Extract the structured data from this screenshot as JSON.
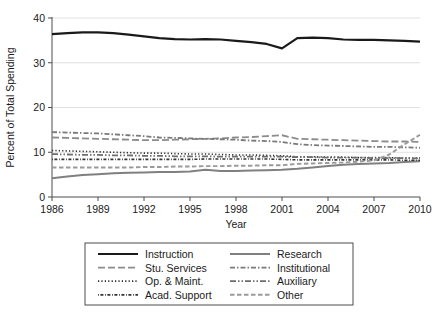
{
  "chart_data": {
    "type": "line",
    "title": "",
    "subtitle": "",
    "xlabel": "Year",
    "ylabel": "Percent of Total Spending",
    "xlim": [
      1986,
      2010
    ],
    "ylim": [
      0,
      40
    ],
    "xticks": [
      1986,
      1989,
      1992,
      1995,
      1998,
      2001,
      2004,
      2007,
      2010
    ],
    "xtick_labels": [
      "1986",
      "1989",
      "1992",
      "1995",
      "1998",
      "2001",
      "2004",
      "2007",
      "2010"
    ],
    "yticks": [
      0,
      10,
      20,
      30,
      40
    ],
    "ytick_labels": [
      "0",
      "10",
      "20",
      "30",
      "40"
    ],
    "grid": "horizontal",
    "legend_position": "below-plot",
    "legend_columns": 2,
    "x": [
      1986,
      1987,
      1988,
      1989,
      1990,
      1991,
      1992,
      1993,
      1994,
      1995,
      1996,
      1997,
      1998,
      1999,
      2000,
      2001,
      2002,
      2003,
      2004,
      2005,
      2006,
      2007,
      2008,
      2009,
      2010
    ],
    "series": [
      {
        "name": "Instruction",
        "color": "#1a1a1a",
        "dash": "none",
        "width": 2.2,
        "values": [
          36.4,
          36.6,
          36.8,
          36.8,
          36.6,
          36.3,
          35.9,
          35.5,
          35.3,
          35.2,
          35.3,
          35.2,
          34.9,
          34.6,
          34.2,
          33.2,
          35.5,
          35.6,
          35.5,
          35.2,
          35.1,
          35.1,
          35.0,
          34.9,
          34.7
        ]
      },
      {
        "name": "Research",
        "color": "#808080",
        "dash": "none",
        "width": 2.0,
        "values": [
          4.2,
          4.6,
          4.9,
          5.1,
          5.3,
          5.4,
          5.5,
          5.6,
          5.6,
          5.7,
          6.1,
          5.8,
          5.8,
          5.9,
          6.0,
          6.1,
          6.3,
          6.6,
          6.9,
          7.2,
          7.4,
          7.5,
          7.6,
          7.8,
          8.0
        ]
      },
      {
        "name": "Stu. Services",
        "color": "#8c8c8c",
        "dash": "7,3",
        "width": 1.8,
        "values": [
          13.3,
          13.2,
          13.1,
          13.0,
          12.9,
          12.8,
          12.7,
          12.7,
          12.8,
          12.9,
          13.0,
          13.1,
          13.3,
          13.4,
          13.6,
          13.8,
          13.0,
          12.9,
          12.8,
          12.7,
          12.6,
          12.5,
          12.4,
          12.4,
          12.3
        ]
      },
      {
        "name": "Institutional",
        "color": "#7a7a7a",
        "dash": "5,2,1.5,2",
        "width": 1.8,
        "values": [
          14.5,
          14.4,
          14.3,
          14.2,
          14.0,
          13.8,
          13.6,
          13.3,
          13.2,
          13.1,
          13.0,
          12.9,
          12.8,
          12.6,
          12.5,
          12.3,
          11.8,
          11.6,
          11.5,
          11.4,
          11.3,
          11.2,
          11.2,
          11.1,
          11.0
        ]
      },
      {
        "name": "Op. & Maint.",
        "color": "#2b2b2b",
        "dash": "1.2,2.2",
        "width": 1.6,
        "values": [
          10.4,
          10.3,
          10.2,
          10.1,
          10.0,
          9.9,
          9.8,
          9.8,
          9.7,
          9.6,
          9.6,
          9.5,
          9.4,
          9.4,
          9.3,
          9.2,
          9.0,
          9.0,
          8.9,
          8.9,
          8.8,
          8.8,
          8.8,
          8.7,
          8.7
        ]
      },
      {
        "name": "Auxiliary",
        "color": "#6e6e6e",
        "dash": "6,2,1.5,2,1.5,2",
        "width": 1.8,
        "values": [
          9.6,
          9.5,
          9.4,
          9.4,
          9.3,
          9.3,
          9.2,
          9.2,
          9.1,
          9.1,
          9.1,
          9.0,
          9.0,
          9.0,
          9.0,
          9.0,
          8.9,
          8.9,
          8.8,
          8.8,
          8.8,
          8.7,
          8.7,
          8.7,
          8.6
        ]
      },
      {
        "name": "Acad. Support",
        "color": "#333333",
        "dash": "0.8,1.6,3,1.6",
        "width": 1.6,
        "values": [
          8.4,
          8.4,
          8.4,
          8.4,
          8.4,
          8.4,
          8.4,
          8.4,
          8.4,
          8.4,
          8.5,
          8.5,
          8.5,
          8.5,
          8.5,
          8.4,
          8.3,
          8.3,
          8.3,
          8.3,
          8.3,
          8.3,
          8.3,
          8.2,
          8.2
        ]
      },
      {
        "name": "Other",
        "color": "#9a9a9a",
        "dash": "4.5,2.5",
        "width": 1.9,
        "values": [
          6.6,
          6.6,
          6.6,
          6.6,
          6.6,
          6.6,
          6.7,
          6.7,
          6.8,
          6.8,
          6.9,
          6.9,
          7.0,
          7.0,
          7.1,
          7.1,
          7.4,
          7.5,
          7.6,
          7.7,
          7.9,
          8.2,
          9.5,
          11.8,
          13.9
        ]
      }
    ]
  },
  "legend": {
    "entries": [
      {
        "label": "Instruction",
        "series": "Instruction"
      },
      {
        "label": "Research",
        "series": "Research"
      },
      {
        "label": "Stu. Services",
        "series": "Stu. Services"
      },
      {
        "label": "Institutional",
        "series": "Institutional"
      },
      {
        "label": "Op. & Maint.",
        "series": "Op. & Maint."
      },
      {
        "label": "Auxiliary",
        "series": "Auxiliary"
      },
      {
        "label": "Acad. Support",
        "series": "Acad. Support"
      },
      {
        "label": "Other",
        "series": "Other"
      }
    ]
  },
  "colors": {
    "background": "#ffffff",
    "axis": "#4d4d4d",
    "grid": "#d9d9d9",
    "text": "#1a1a1a",
    "legend_border": "#4d4d4d"
  }
}
